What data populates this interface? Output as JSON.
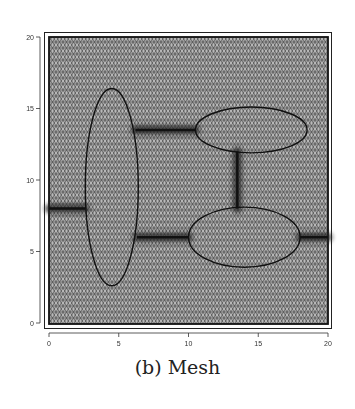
{
  "caption": "(b) Mesh",
  "chart_data": {
    "type": "mesh",
    "title": "",
    "caption": "(b) Mesh",
    "xlabel": "",
    "ylabel": "",
    "xlim": [
      0,
      20
    ],
    "ylim": [
      0,
      20
    ],
    "xticks": [
      0,
      5,
      10,
      15,
      20
    ],
    "yticks": [
      0,
      5,
      10,
      15,
      20
    ],
    "xtick_labels": [
      "0",
      "5",
      "10",
      "15",
      "20"
    ],
    "ytick_labels": [
      "0",
      "5",
      "10",
      "15",
      "20"
    ],
    "grid": false,
    "legend": null,
    "ellipses": [
      {
        "name": "left-vertical-ellipse",
        "cx": 4.5,
        "cy": 9.5,
        "rx": 1.9,
        "ry": 6.9
      },
      {
        "name": "top-right-ellipse",
        "cx": 14.5,
        "cy": 13.5,
        "rx": 4.0,
        "ry": 1.6
      },
      {
        "name": "bottom-right-ellipse",
        "cx": 14.0,
        "cy": 6.0,
        "rx": 4.0,
        "ry": 2.1
      }
    ],
    "refined_segments": [
      {
        "name": "left-inlet",
        "x1": 0,
        "y1": 8,
        "x2": 2.6,
        "y2": 8
      },
      {
        "name": "upper-connector",
        "x1": 6.2,
        "y1": 13.5,
        "x2": 10.5,
        "y2": 13.5
      },
      {
        "name": "lower-connector",
        "x1": 6.3,
        "y1": 6.0,
        "x2": 10.0,
        "y2": 6.0
      },
      {
        "name": "vertical-connector",
        "x1": 13.5,
        "y1": 12.0,
        "x2": 13.5,
        "y2": 8.0
      },
      {
        "name": "right-outlet",
        "x1": 18.0,
        "y1": 6.0,
        "x2": 20.0,
        "y2": 6.0
      }
    ],
    "colors": {
      "mesh_fill": "#8c8c8c",
      "edge": "#1a1a1a",
      "background": "#ffffff"
    }
  }
}
